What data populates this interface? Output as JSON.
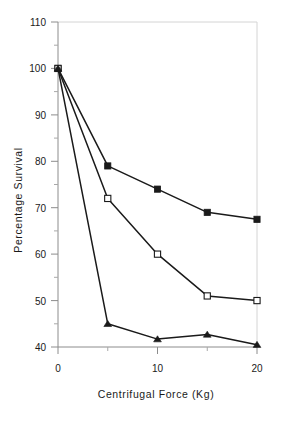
{
  "chart_data": {
    "type": "line",
    "title": "",
    "subtitle": "",
    "xlabel": "Centrifugal Force  (Kg)",
    "ylabel": "Percentage Survival",
    "xlim": [
      0,
      20
    ],
    "ylim": [
      40,
      110
    ],
    "grid": false,
    "legend": "none",
    "x_major_ticks": [
      0,
      10,
      20
    ],
    "x_major_tick_labels": [
      "0",
      "10",
      "20"
    ],
    "x_minor_ticks": [
      5,
      15
    ],
    "y_major_ticks": [
      40,
      50,
      60,
      70,
      80,
      90,
      100,
      110
    ],
    "y_major_tick_labels": [
      "40",
      "50",
      "60",
      "70",
      "80",
      "90",
      "100",
      "110"
    ],
    "y_minor_ticks": [
      45,
      55,
      65,
      75,
      85,
      95,
      105
    ],
    "x": [
      0,
      5,
      10,
      15,
      20
    ],
    "series": [
      {
        "name": "filled-square-series",
        "marker": "filled-square",
        "color": "#1a1a1a",
        "values": [
          100,
          79,
          74,
          69,
          67.5
        ]
      },
      {
        "name": "open-square-series",
        "marker": "open-square",
        "color": "#1a1a1a",
        "values": [
          100,
          72,
          60,
          51,
          50
        ]
      },
      {
        "name": "filled-triangle-series",
        "marker": "filled-triangle",
        "color": "#1a1a1a",
        "values": [
          100,
          45,
          41.7,
          42.7,
          40.5
        ]
      }
    ]
  },
  "axes": {
    "y_title": "Percentage Survival",
    "x_title": "Centrifugal Force  (Kg)",
    "y_labels": {
      "t110": "110",
      "t100": "100",
      "t90": "90",
      "t80": "80",
      "t70": "70",
      "t60": "60",
      "t50": "50",
      "t40": "40"
    },
    "x_labels": {
      "t0": "0",
      "t10": "10",
      "t20": "20"
    }
  },
  "colors": {
    "axis": "#8c8c8c",
    "frame": "#d4d4d4",
    "line": "#1a1a1a",
    "marker_fill": "#1a1a1a",
    "marker_open_fill": "#ffffff",
    "text": "#1a1a1a",
    "background": "#ffffff"
  }
}
